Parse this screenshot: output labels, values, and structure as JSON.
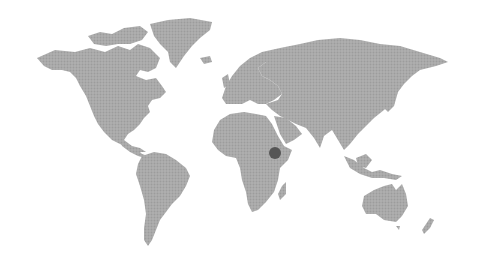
{
  "map": {
    "type": "world-map",
    "style": "halftone-dotted",
    "colors": {
      "background": "#ffffff",
      "land": "#a9a9a9",
      "land_dot": "#9a9a9a",
      "marker": "#555555"
    },
    "continents": [
      "North America",
      "Greenland",
      "South America",
      "Europe",
      "Africa",
      "Asia",
      "Australia",
      "New Zealand",
      "Madagascar"
    ],
    "markers": [
      {
        "name": "Ethiopia",
        "x": 275,
        "y": 153,
        "radius": 6
      }
    ]
  }
}
